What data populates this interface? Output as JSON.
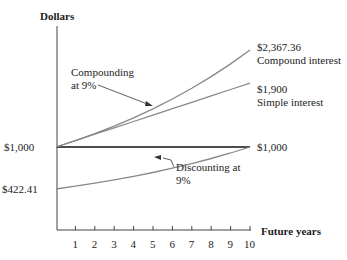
{
  "chart_data": {
    "type": "line",
    "title": "",
    "xlabel": "Future years",
    "ylabel": "Dollars",
    "x": [
      0,
      1,
      2,
      3,
      4,
      5,
      6,
      7,
      8,
      9,
      10
    ],
    "xticks": [
      "1",
      "2",
      "3",
      "4",
      "5",
      "6",
      "7",
      "8",
      "9",
      "10"
    ],
    "series": [
      {
        "name": "Compound interest",
        "values": [
          1000,
          1090,
          1188.1,
          1295.03,
          1411.58,
          1538.62,
          1677.1,
          1828.04,
          1992.56,
          2171.89,
          2367.36
        ],
        "end_label": "$2,367.36"
      },
      {
        "name": "Simple interest",
        "values": [
          1000,
          1090,
          1180,
          1270,
          1360,
          1450,
          1540,
          1630,
          1720,
          1810,
          1900
        ],
        "end_label": "$1,900"
      },
      {
        "name": "Principal",
        "values": [
          1000,
          1000,
          1000,
          1000,
          1000,
          1000,
          1000,
          1000,
          1000,
          1000,
          1000
        ],
        "end_label": "$1,000"
      },
      {
        "name": "Discounting at 9%",
        "values": [
          422.41,
          460.43,
          501.87,
          547.03,
          596.27,
          649.93,
          708.43,
          772.18,
          841.68,
          917.43,
          1000
        ],
        "start_label": "$422.41",
        "end_label": "$1,000"
      }
    ],
    "annotations": [
      "Compounding at 9%",
      "Discounting at 9%"
    ],
    "grid": false
  },
  "labels": {
    "ylabel": "Dollars",
    "xlabel": "Future years",
    "y_1000": "$1,000",
    "y_422": "$422.41",
    "compound_value": "$2,367.36",
    "compound_name": "Compound interest",
    "simple_value": "$1,900",
    "simple_name": "Simple interest",
    "end_1000": "$1,000",
    "ann_compound_1": "Compounding",
    "ann_compound_2": "at 9%",
    "ann_discount_1": "Discounting at",
    "ann_discount_2": "9%",
    "ticks": [
      "1",
      "2",
      "3",
      "4",
      "5",
      "6",
      "7",
      "8",
      "9",
      "10"
    ]
  }
}
